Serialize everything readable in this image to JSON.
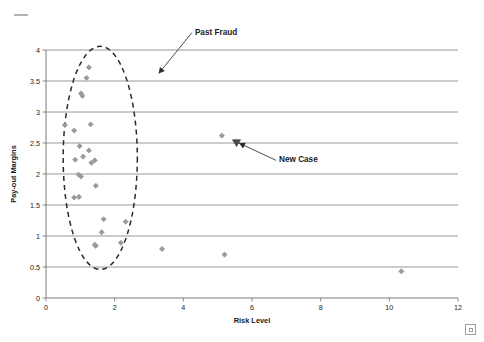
{
  "chart_data": {
    "type": "scatter",
    "title": "",
    "xlabel": "Risk Level",
    "ylabel": "Pay-out Margins",
    "xlim": [
      0,
      12
    ],
    "ylim": [
      0,
      4
    ],
    "xticks": [
      "0",
      "2",
      "4",
      "6",
      "8",
      "10",
      "12"
    ],
    "yticks": [
      "0",
      "0.5",
      "1",
      "1.5",
      "2",
      "2.5",
      "3",
      "3.5",
      "4"
    ],
    "grid": "horizontal",
    "legend": "none",
    "series": [
      {
        "name": "Cases",
        "marker": "diamond",
        "color": "#9a9a9a",
        "points": [
          [
            1.25,
            3.72
          ],
          [
            1.18,
            3.55
          ],
          [
            1.02,
            3.3
          ],
          [
            1.06,
            3.26
          ],
          [
            0.55,
            2.79
          ],
          [
            1.3,
            2.8
          ],
          [
            0.82,
            2.7
          ],
          [
            0.98,
            2.45
          ],
          [
            1.25,
            2.38
          ],
          [
            0.85,
            2.23
          ],
          [
            1.08,
            2.28
          ],
          [
            1.42,
            2.22
          ],
          [
            1.32,
            2.18
          ],
          [
            0.95,
            1.99
          ],
          [
            1.02,
            1.96
          ],
          [
            1.45,
            1.81
          ],
          [
            0.82,
            1.62
          ],
          [
            0.96,
            1.63
          ],
          [
            1.68,
            1.27
          ],
          [
            2.32,
            1.23
          ],
          [
            1.62,
            1.06
          ],
          [
            1.42,
            0.86
          ],
          [
            1.45,
            0.84
          ],
          [
            2.18,
            0.89
          ],
          [
            3.38,
            0.79
          ],
          [
            5.2,
            0.7
          ],
          [
            10.35,
            0.43
          ],
          [
            5.12,
            2.62
          ]
        ]
      },
      {
        "name": "New Case",
        "marker": "triangle-down",
        "color": "#4a4a4a",
        "points": [
          [
            5.55,
            2.5
          ]
        ]
      }
    ],
    "annotations": [
      {
        "label": "Past Fraud",
        "text_x": 4.25,
        "text_y": 4.28,
        "arrow_to_x": 3.28,
        "arrow_to_y": 3.62
      },
      {
        "label": "New Case",
        "text_x": 6.7,
        "text_y": 2.22,
        "arrow_to_x": 5.62,
        "arrow_to_y": 2.5
      }
    ],
    "highlight_region": {
      "shape": "ellipse-dashed",
      "center_x": 1.58,
      "center_y": 2.26,
      "radius_x": 1.08,
      "radius_y": 1.8,
      "label": "past-fraud-cluster"
    }
  },
  "artifacts": {
    "corner_mark": "scan-dash-mark",
    "page_glyph": "scan-box-glyph"
  }
}
